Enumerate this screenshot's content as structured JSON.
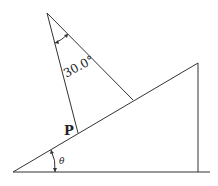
{
  "diagram": {
    "type": "physics-incline-with-suspended-strings",
    "labels": {
      "apex_angle": "30.0°",
      "point": "P",
      "incline_angle": "θ"
    },
    "geometry": {
      "apex": [
        47,
        13
      ],
      "incline_bottom": [
        13,
        172
      ],
      "incline_top": [
        198,
        63
      ],
      "base_right": [
        210,
        172
      ],
      "string_left_foot": [
        78,
        133
      ],
      "string_right_foot": [
        133,
        100
      ]
    },
    "colors": {
      "line": "#333333",
      "text": "#222222",
      "background": "#ffffff"
    }
  }
}
